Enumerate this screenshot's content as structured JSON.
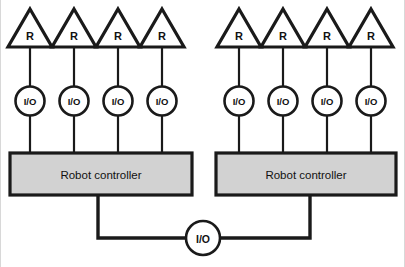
{
  "diagram": {
    "background_color": "#ffffff",
    "line_color": "#1a1a1a",
    "controller_fill": "#d2d2d2",
    "node_fill": "#ffffff"
  },
  "labels": {
    "robot": "R",
    "io": "I/O",
    "controller": "Robot controller"
  },
  "cells": [
    {
      "name": "left-cell",
      "controller_label": "Robot controller",
      "robots": [
        {
          "label": "R",
          "io_label": "I/O"
        },
        {
          "label": "R",
          "io_label": "I/O"
        },
        {
          "label": "R",
          "io_label": "I/O"
        },
        {
          "label": "R",
          "io_label": "I/O"
        }
      ]
    },
    {
      "name": "right-cell",
      "controller_label": "Robot controller",
      "robots": [
        {
          "label": "R",
          "io_label": "I/O"
        },
        {
          "label": "R",
          "io_label": "I/O"
        },
        {
          "label": "R",
          "io_label": "I/O"
        },
        {
          "label": "R",
          "io_label": "I/O"
        }
      ]
    }
  ],
  "shared_bus": {
    "io_label": "I/O"
  }
}
